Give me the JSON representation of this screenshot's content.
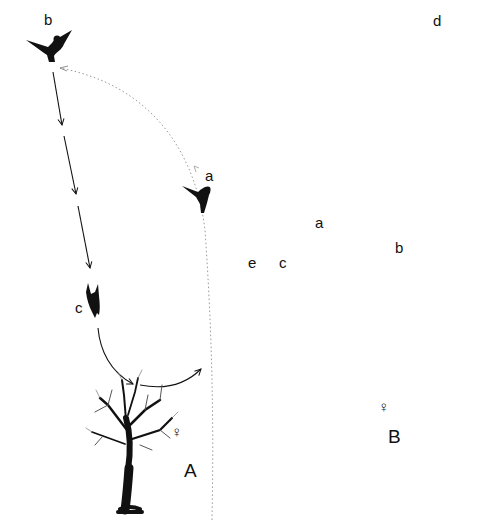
{
  "figure": {
    "colors": {
      "ink": "#111111",
      "dotted": "#9a9a9a",
      "background": "#ffffff"
    }
  },
  "panel_A": {
    "label": "A",
    "female_symbol": "♀",
    "positions": [
      {
        "id": "a",
        "label": "a"
      },
      {
        "id": "b",
        "label": "b"
      },
      {
        "id": "c",
        "label": "c"
      }
    ],
    "paths": [
      {
        "from": "a",
        "to": "b",
        "style": "dotted",
        "shape": "arc"
      },
      {
        "from": "b",
        "to": "c",
        "style": "solid-arrows",
        "shape": "straight dive"
      },
      {
        "from": "c",
        "to": "a",
        "style": "solid-arrows",
        "shape": "U swoop"
      }
    ]
  },
  "panel_B": {
    "label": "B",
    "female_symbol": "♀",
    "positions": [
      {
        "id": "a",
        "label": "a"
      },
      {
        "id": "b",
        "label": "b"
      },
      {
        "id": "c",
        "label": "c"
      },
      {
        "id": "d",
        "label": "d"
      },
      {
        "id": "e",
        "label": "e"
      }
    ],
    "paths": [
      {
        "from": "a",
        "to": "b",
        "style": "solid-arrows",
        "shape": "arc"
      },
      {
        "from": "b",
        "to": "c",
        "style": "solid-arrows",
        "shape": "arc"
      },
      {
        "from": "c",
        "to": "b",
        "style": "solid-arrows",
        "shape": "arc"
      },
      {
        "from": "b",
        "to": "d",
        "style": "dotted wavy",
        "shape": "climb"
      },
      {
        "from": "d",
        "to": "e",
        "style": "solid-arrows",
        "shape": "dive and arc"
      }
    ]
  }
}
